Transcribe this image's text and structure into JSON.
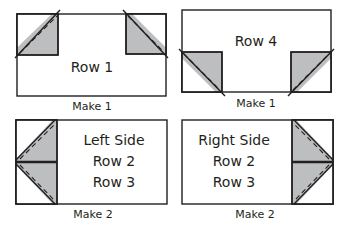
{
  "colors": {
    "outline": "#231f20",
    "fill": "#bcbec0",
    "background": "#ffffff"
  },
  "blocks": [
    {
      "id": "row-1",
      "label_lines": [
        "Row 1"
      ],
      "caption": "Make 1"
    },
    {
      "id": "row-4",
      "label_lines": [
        "Row 4"
      ],
      "caption": "Make 1"
    },
    {
      "id": "left-side",
      "label_lines": [
        "Left Side",
        "Row 2",
        "Row 3"
      ],
      "caption": "Make 2"
    },
    {
      "id": "right-side",
      "label_lines": [
        "Right Side",
        "Row 2",
        "Row 3"
      ],
      "caption": "Make 2"
    }
  ]
}
